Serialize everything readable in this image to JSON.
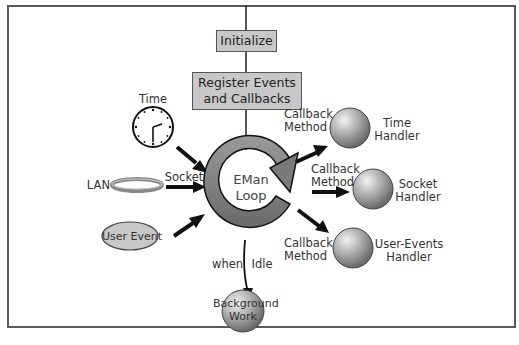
{
  "diagram": {
    "initialize": "Initialize",
    "register": {
      "line1": "Register Events",
      "line2": "and Callbacks"
    },
    "loop": {
      "line1": "EMan",
      "line2": "Loop"
    },
    "inputs": {
      "time": "Time",
      "lan": "LAN",
      "socket": "Socket",
      "user_event": "User Event"
    },
    "handlers": [
      {
        "callback_line1": "Callback",
        "callback_line2": "Method",
        "name_line1": "Time",
        "name_line2": "Handler"
      },
      {
        "callback_line1": "Callback",
        "callback_line2": "Method",
        "name_line1": "Socket",
        "name_line2": "Handler"
      },
      {
        "callback_line1": "Callback",
        "callback_line2": "Method",
        "name_line1": "User-Events",
        "name_line2": "Handler"
      }
    ],
    "idle": {
      "when": "when",
      "idle": "Idle"
    },
    "background": {
      "line1": "Background",
      "line2": "Work"
    },
    "colors": {
      "box_fill": "#c8c8c8",
      "loop_fill": "#7a7a7a",
      "sphere_fill": "#a0a0a0",
      "frame": "#5a5a5a",
      "arrow": "#111111"
    }
  }
}
